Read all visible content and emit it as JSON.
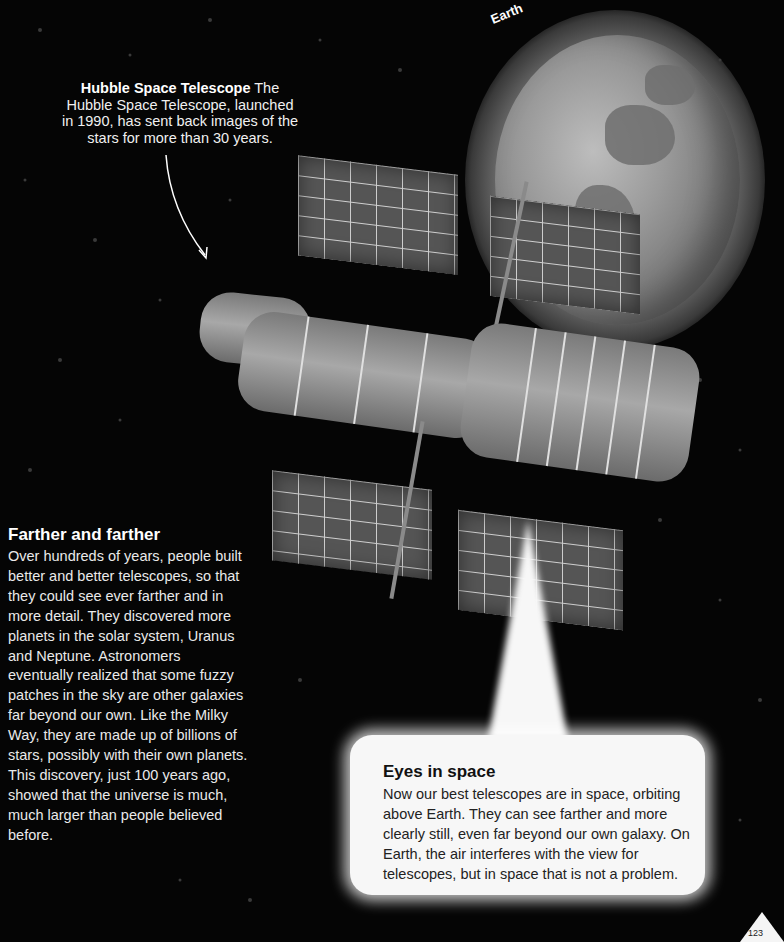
{
  "earth_label": "Earth",
  "hubble_callout": {
    "title": "Hubble Space Telescope",
    "body": "The Hubble Space Telescope, launched in 1990, has sent back images of the stars for more than 30 years."
  },
  "farther_section": {
    "heading": "Farther and farther",
    "body": "Over hundreds of years, people built better and better telescopes, so that they could see ever farther and in more detail. They discovered more planets in the solar system, Uranus and Neptune. Astronomers eventually realized that some fuzzy patches in the sky are other galaxies far beyond our own. Like the Milky Way, they are made up of billions of stars, possibly with their own planets. This discovery, just 100 years ago, showed that the universe is much, much larger than people believed before."
  },
  "eyes_section": {
    "heading": "Eyes in space",
    "body": "Now our best telescopes are in space, orbiting above Earth. They can see farther and more clearly still, even far beyond our own galaxy. On Earth, the air interferes with the view for telescopes, but in space that is not a problem."
  },
  "page_number": "123",
  "colors": {
    "background": "#050505",
    "text_light": "#f2f2f2",
    "bubble": "#f7f7f7",
    "text_dark": "#1a1a1a"
  }
}
